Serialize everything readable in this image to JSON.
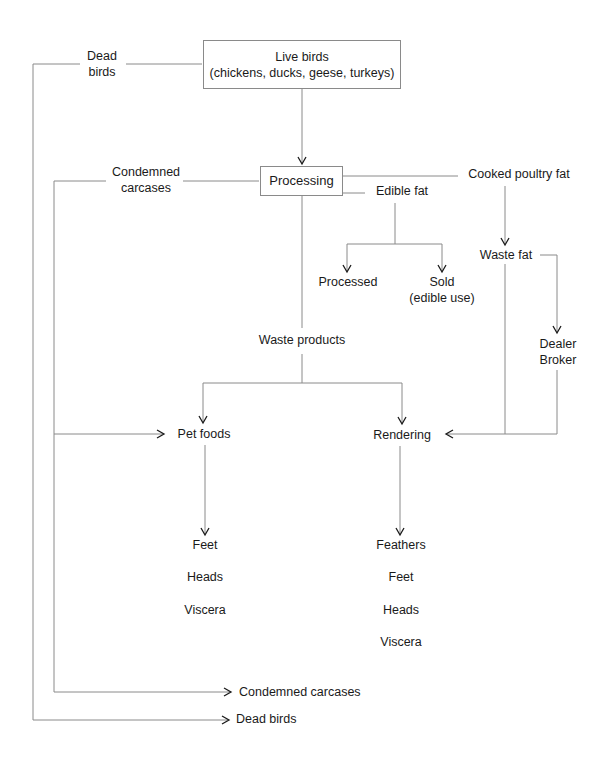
{
  "diagram": {
    "type": "flowchart",
    "nodes": {
      "live_birds": {
        "line1": "Live birds",
        "line2": "(chickens, ducks, geese, turkeys)"
      },
      "processing": "Processing",
      "dead_birds_top": {
        "line1": "Dead",
        "line2": "birds"
      },
      "condemned_top": {
        "line1": "Condemned",
        "line2": "carcases"
      },
      "cooked_poultry_fat": "Cooked poultry fat",
      "edible_fat": "Edible fat",
      "processed": "Processed",
      "sold": {
        "line1": "Sold",
        "line2": "(edible use)"
      },
      "waste_fat": "Waste fat",
      "dealer_broker": {
        "line1": "Dealer",
        "line2": "Broker"
      },
      "waste_products": "Waste products",
      "pet_foods": "Pet foods",
      "rendering": "Rendering",
      "pet_foods_items": [
        "Feet",
        "Heads",
        "Viscera"
      ],
      "rendering_items": [
        "Feathers",
        "Feet",
        "Heads",
        "Viscera"
      ],
      "condemned_bottom": "Condemned carcases",
      "dead_birds_bottom": "Dead birds"
    },
    "edges": [
      {
        "from": "Live birds",
        "to": "Processing"
      },
      {
        "from": "Live birds",
        "to": "Dead birds (bottom)",
        "via": "Dead birds label"
      },
      {
        "from": "Processing",
        "to": "Condemned carcases (bottom)",
        "via": "Condemned carcases label"
      },
      {
        "from": "Condemned carcases line",
        "to": "Pet foods"
      },
      {
        "from": "Processing",
        "to": "Cooked poultry fat"
      },
      {
        "from": "Processing",
        "to": "Edible fat"
      },
      {
        "from": "Edible fat",
        "to": "Processed"
      },
      {
        "from": "Edible fat",
        "to": "Sold (edible use)"
      },
      {
        "from": "Cooked poultry fat",
        "to": "Waste fat"
      },
      {
        "from": "Waste fat",
        "to": "Dealer Broker"
      },
      {
        "from": "Waste fat",
        "to": "Rendering"
      },
      {
        "from": "Dealer Broker",
        "to": "Rendering"
      },
      {
        "from": "Processing",
        "to": "Waste products"
      },
      {
        "from": "Waste products",
        "to": "Pet foods"
      },
      {
        "from": "Waste products",
        "to": "Rendering"
      },
      {
        "from": "Pet foods",
        "to": "Feet, Heads, Viscera"
      },
      {
        "from": "Rendering",
        "to": "Feathers, Feet, Heads, Viscera"
      }
    ],
    "colors": {
      "line": "#8a8a8a",
      "arrow": "#1a1a1a",
      "text": "#1a1a1a",
      "background": "#ffffff"
    }
  }
}
